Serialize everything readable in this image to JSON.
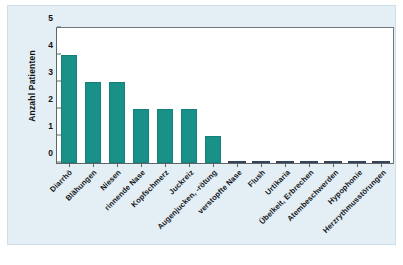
{
  "figure": {
    "background_color": "#ffffff",
    "panel_color": "#e3eef5",
    "plot_background": "#ffffff",
    "bar_color": "#1a9188",
    "zero_bar_color": "#3d4f61",
    "axis_color": "#5d6769"
  },
  "chart_data": {
    "type": "bar",
    "title": "",
    "subtitle": "",
    "xlabel": "",
    "ylabel": "Anzahl Patienten",
    "ylim": [
      0,
      5
    ],
    "yticks": [
      0,
      1,
      2,
      3,
      4,
      5
    ],
    "ytick_labels": [
      "0",
      "1",
      "2",
      "3",
      "4",
      "5"
    ],
    "grid": false,
    "legend": false,
    "legend_position": "none",
    "xtick_rotation": -45,
    "categories": [
      "Diarrhö",
      "Blähungen",
      "Niesen",
      "rinnende Nase",
      "Kopfschmerz",
      "Juckreiz",
      "Augenjucken, -rötung",
      "verstopfte Nase",
      "Flush",
      "Urtikaria",
      "Übelkeit, Erbrechen",
      "Atembeschwerden",
      "Hypophonie",
      "Herzrythmusstörungen"
    ],
    "values": [
      4,
      3,
      3,
      2,
      2,
      2,
      1,
      0,
      0,
      0,
      0,
      0,
      0,
      0
    ],
    "series": [
      {
        "name": "Anzahl Patienten",
        "color": "#1a9188",
        "values": [
          4,
          3,
          3,
          2,
          2,
          2,
          1,
          0,
          0,
          0,
          0,
          0,
          0,
          0
        ]
      }
    ]
  }
}
